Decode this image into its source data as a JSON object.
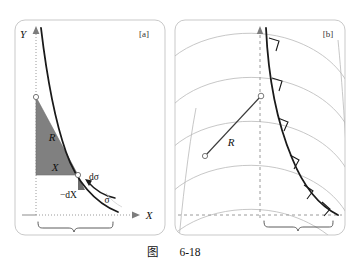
{
  "figure": {
    "caption_cjk": "图",
    "caption_number": "6-18",
    "background_color": "#ffffff",
    "shade_color": "#808080",
    "curve_color": "#1a1a1a",
    "arc_color": "#b9b9b9",
    "frame_color": "#c9c9c9"
  },
  "panel_a": {
    "tag": "[a]",
    "axis_y_label": "Y",
    "axis_x_label": "X",
    "triangle_label_upper": "R",
    "triangle_label_lower": "X",
    "element_label": "dσ",
    "differential_label": "−dX",
    "angle_label": "σ",
    "brace_label": "R"
  },
  "panel_b": {
    "tag": "[b]",
    "radius_label": "R",
    "brace_label": "R",
    "right_angle_count": 6,
    "arc_family_count": 5
  }
}
